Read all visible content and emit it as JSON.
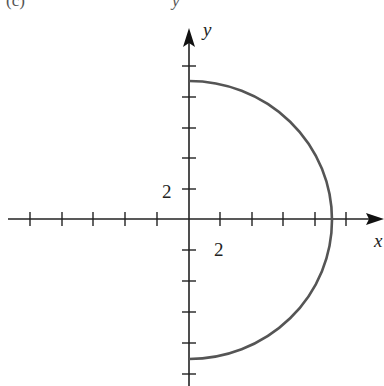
{
  "header": {
    "partial_caption_left": "(c)",
    "partial_caption_right": "y"
  },
  "axes": {
    "x_label": "x",
    "y_label": "y",
    "x_tick_label": "2",
    "y_tick_label": "2",
    "tick_step": 2,
    "x_ticks": [
      -10,
      -8,
      -6,
      -4,
      -2,
      2,
      4,
      6,
      8,
      10
    ],
    "y_ticks": [
      -10,
      -8,
      -6,
      -4,
      -2,
      2,
      4,
      6,
      8,
      10
    ]
  },
  "curve": {
    "type": "semicircle",
    "description": "right half of circle x^2 + y^2 = 81, x >= 0",
    "center": [
      0,
      0
    ],
    "radius": 9,
    "color": "#555555"
  },
  "colors": {
    "axis": "#222222",
    "curve": "#555555",
    "background": "#ffffff"
  }
}
